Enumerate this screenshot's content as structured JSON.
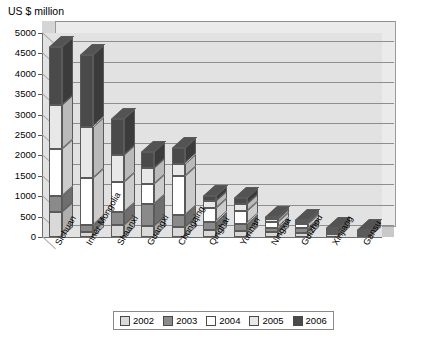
{
  "chart_data": {
    "type": "bar",
    "subtype": "stacked-column-3d",
    "title": "US $ million",
    "ylabel": "US $ million",
    "xlabel": "",
    "ylim": [
      0,
      5000
    ],
    "ytick_step": 500,
    "yticks": [
      "0",
      "500",
      "1000",
      "1500",
      "2000",
      "2500",
      "3000",
      "3500",
      "4000",
      "4500",
      "5000"
    ],
    "grid": true,
    "legend_position": "bottom",
    "categories": [
      "Sichuan",
      "Inner Mongolia",
      "Shaanxi",
      "Guangxi",
      "Chongqing",
      "Qinghai",
      "Yunnan",
      "Ningxia",
      "Guizhou",
      "Xinjiang",
      "Gansu"
    ],
    "series": [
      {
        "name": "2002",
        "color": "#d9d9d9",
        "values": [
          620,
          120,
          300,
          270,
          250,
          170,
          150,
          120,
          110,
          70,
          40
        ]
      },
      {
        "name": "2003",
        "color": "#8a8a8a",
        "values": [
          380,
          180,
          320,
          530,
          300,
          200,
          180,
          110,
          100,
          60,
          40
        ]
      },
      {
        "name": "2004",
        "color": "#ffffff",
        "values": [
          1150,
          1150,
          730,
          500,
          950,
          330,
          300,
          130,
          110,
          50,
          40
        ]
      },
      {
        "name": "2005",
        "color": "#e8e8e8",
        "values": [
          1080,
          1250,
          650,
          400,
          300,
          180,
          180,
          80,
          50,
          30,
          20
        ]
      },
      {
        "name": "2006",
        "color": "#4a4a4a",
        "values": [
          1420,
          1750,
          880,
          380,
          370,
          120,
          140,
          60,
          50,
          20,
          20
        ]
      }
    ],
    "totals": [
      4650,
      4450,
      2880,
      2080,
      2170,
      1000,
      950,
      500,
      420,
      230,
      160
    ]
  },
  "legend": {
    "items": [
      {
        "label": "2002"
      },
      {
        "label": "2003"
      },
      {
        "label": "2004"
      },
      {
        "label": "2005"
      },
      {
        "label": "2006"
      }
    ]
  }
}
